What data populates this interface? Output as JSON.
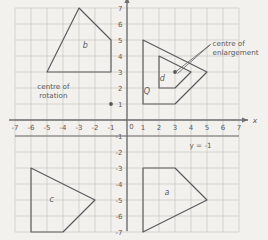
{
  "figure": {
    "kind": "hand-drawn-maths-worksheet",
    "background_color": "#f3f1ed",
    "ink_color": "#5a5a5c",
    "grid_color": "#c9c6c0",
    "axis_color": "#6f6f71"
  },
  "axes": {
    "x_label": "x",
    "y_label": "y",
    "x_min": -7,
    "x_max": 7,
    "y_min": -7,
    "y_max": 7,
    "x_ticks": [
      "-7",
      "-6",
      "-5",
      "-4",
      "-3",
      "-2",
      "-1",
      "0",
      "1",
      "2",
      "3",
      "4",
      "5",
      "6",
      "7"
    ],
    "y_ticks": [
      "7",
      "6",
      "5",
      "4",
      "3",
      "2",
      "1",
      "0",
      "-1",
      "-2",
      "-3",
      "-4",
      "-5",
      "-6",
      "-7"
    ],
    "origin_label": "0"
  },
  "annotations": [
    {
      "id": "centre-of-rotation",
      "line1": "centre of",
      "line2": "rotation",
      "point": {
        "x": -1,
        "y": 1
      },
      "text_x": -4.6,
      "text_y": 1.95
    },
    {
      "id": "centre-of-enlargement",
      "line1": "centre of",
      "line2": "enlargement",
      "point": {
        "x": 3,
        "y": 3
      },
      "text_x": 5.35,
      "text_y": 4.6
    },
    {
      "id": "line-y-equals-minus-1",
      "line1": "y = -1",
      "line2": "",
      "text_x": 4.6,
      "text_y": -1.75
    }
  ],
  "shapes": [
    {
      "label": "b",
      "label_x": -2.6,
      "label_y": 4.5,
      "points": [
        [
          -3,
          7
        ],
        [
          -1,
          5
        ],
        [
          -1,
          3
        ],
        [
          -5,
          3
        ]
      ]
    },
    {
      "label": "Q",
      "label_x": 1.25,
      "label_y": 1.6,
      "points": [
        [
          1,
          5
        ],
        [
          5,
          3
        ],
        [
          3,
          1
        ],
        [
          1,
          1
        ]
      ]
    },
    {
      "label": "d",
      "label_x": 2.2,
      "label_y": 2.45,
      "points": [
        [
          2,
          4
        ],
        [
          4,
          3
        ],
        [
          3,
          2
        ],
        [
          2,
          2
        ]
      ]
    },
    {
      "label": "c",
      "label_x": -4.7,
      "label_y": -5.1,
      "points": [
        [
          -6,
          -3
        ],
        [
          -2,
          -5
        ],
        [
          -4,
          -7
        ],
        [
          -6,
          -7
        ]
      ]
    },
    {
      "label": "a",
      "label_x": 2.5,
      "label_y": -4.7,
      "points": [
        [
          1,
          -3
        ],
        [
          3,
          -3
        ],
        [
          5,
          -5
        ],
        [
          1,
          -7
        ]
      ]
    }
  ],
  "chart_data": {
    "type": "scatter",
    "title": "",
    "xlabel": "x",
    "ylabel": "y",
    "xlim": [
      -7,
      7
    ],
    "ylim": [
      -7,
      7
    ],
    "grid": true,
    "legend": "none",
    "polygons": [
      {
        "name": "b",
        "vertices": [
          [
            -3,
            7
          ],
          [
            -1,
            5
          ],
          [
            -1,
            3
          ],
          [
            -5,
            3
          ]
        ]
      },
      {
        "name": "Q",
        "vertices": [
          [
            1,
            5
          ],
          [
            5,
            3
          ],
          [
            3,
            1
          ],
          [
            1,
            1
          ]
        ]
      },
      {
        "name": "d",
        "vertices": [
          [
            2,
            4
          ],
          [
            4,
            3
          ],
          [
            3,
            2
          ],
          [
            2,
            2
          ]
        ]
      },
      {
        "name": "c",
        "vertices": [
          [
            -6,
            -3
          ],
          [
            -2,
            -5
          ],
          [
            -4,
            -7
          ],
          [
            -6,
            -7
          ]
        ]
      },
      {
        "name": "a",
        "vertices": [
          [
            1,
            -3
          ],
          [
            3,
            -3
          ],
          [
            5,
            -5
          ],
          [
            1,
            -7
          ]
        ]
      }
    ],
    "points": [
      {
        "name": "centre of rotation",
        "x": -1,
        "y": 1
      },
      {
        "name": "centre of enlargement",
        "x": 3,
        "y": 3
      }
    ],
    "lines": [
      {
        "name": "y = -1",
        "equation": "y = -1",
        "y": -1
      }
    ]
  }
}
